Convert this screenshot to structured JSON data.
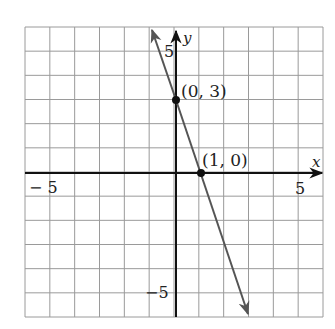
{
  "chart_data": {
    "type": "line",
    "title": "",
    "xlabel": "x",
    "ylabel": "y",
    "xlim": [
      -6,
      6
    ],
    "ylim": [
      -6,
      6
    ],
    "grid": true,
    "x_tick_labels": [
      {
        "value": -5,
        "label": "− 5"
      },
      {
        "value": 5,
        "label": "5"
      }
    ],
    "y_tick_labels": [
      {
        "value": 5,
        "label": "5"
      },
      {
        "value": -5,
        "label": "−5"
      }
    ],
    "series": [
      {
        "name": "y = -3x + 3",
        "equation": "y = -3x + 3",
        "slope": -3,
        "intercept": 3,
        "x": [
          -1,
          2.45
        ],
        "y": [
          6,
          -4.35
        ],
        "arrows": "both"
      }
    ],
    "points": [
      {
        "x": 0,
        "y": 3,
        "label": "(0, 3)"
      },
      {
        "x": 1,
        "y": 0,
        "label": "(1, 0)"
      }
    ]
  },
  "labels": {
    "x_axis": "x",
    "y_axis": "y",
    "x_neg5": "− 5",
    "x_pos5": "5",
    "y_pos5": "5",
    "y_neg5": "−5",
    "point_a": "(0, 3)",
    "point_b": "(1, 0)"
  },
  "colors": {
    "grid": "#9a9a9a",
    "axis": "#111111",
    "line": "#555555",
    "point": "#111111"
  }
}
